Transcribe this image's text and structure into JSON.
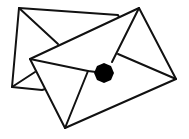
{
  "illustration": {
    "subject": "two envelopes",
    "stroke_color": "#111111",
    "fill_color": "#ffffff",
    "seal_color": "#000000",
    "icons": [
      "back-envelope-icon",
      "front-envelope-icon",
      "wax-seal-icon"
    ]
  }
}
